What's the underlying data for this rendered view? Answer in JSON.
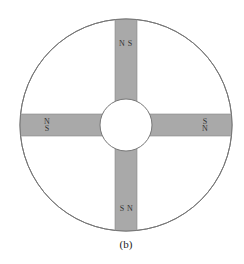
{
  "figure": {
    "caption": "(b)",
    "colors": {
      "background": "#ffffff",
      "magnet_fill": "#a9a9a9",
      "outline": "#777777"
    },
    "outer_circle": {
      "cx": 126,
      "cy": 125,
      "r": 106
    },
    "inner_circle": {
      "cx": 126,
      "cy": 125,
      "r": 26
    },
    "magnets": [
      {
        "position": "top",
        "pole_1": "N",
        "pole_2": "S",
        "orientation": "horizontal-text"
      },
      {
        "position": "left",
        "pole_1": "N",
        "pole_2": "S",
        "orientation": "stacked-text"
      },
      {
        "position": "right",
        "pole_1": "S",
        "pole_2": "N",
        "orientation": "stacked-text"
      },
      {
        "position": "bottom",
        "pole_1": "S",
        "pole_2": "N",
        "orientation": "horizontal-text"
      }
    ]
  }
}
